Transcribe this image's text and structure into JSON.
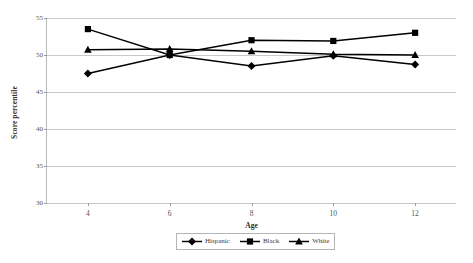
{
  "chart_data": {
    "type": "line",
    "title": "",
    "xlabel": "Age",
    "ylabel": "Score percentile",
    "x": [
      4,
      6,
      8,
      10,
      12
    ],
    "categories": [
      "4",
      "6",
      "8",
      "10",
      "12"
    ],
    "xlim": [
      3,
      13
    ],
    "ylim": [
      30,
      55
    ],
    "yticks": [
      30,
      35,
      40,
      45,
      50,
      55
    ],
    "ytick_labels": [
      "30",
      "35",
      "40",
      "45",
      "50",
      "55"
    ],
    "xtick_labels": [
      "4",
      "6",
      "8",
      "10",
      "12"
    ],
    "grid": "horizontal",
    "legend_position": "bottom",
    "series": [
      {
        "name": "Hispanic",
        "marker": "diamond",
        "color": "#000000",
        "values": [
          47.5,
          50.0,
          48.5,
          49.9,
          48.7
        ]
      },
      {
        "name": "Black",
        "marker": "square",
        "color": "#000000",
        "values": [
          53.5,
          50.0,
          52.0,
          51.9,
          53.0
        ]
      },
      {
        "name": "White",
        "marker": "triangle",
        "color": "#000000",
        "values": [
          50.7,
          50.8,
          50.5,
          50.1,
          50.0
        ]
      }
    ]
  },
  "legend": {
    "items": [
      {
        "label": "Hispanic"
      },
      {
        "label": "Black"
      },
      {
        "label": "White"
      }
    ]
  },
  "axes": {
    "x_title": "Age",
    "y_title": "Score percentile"
  }
}
